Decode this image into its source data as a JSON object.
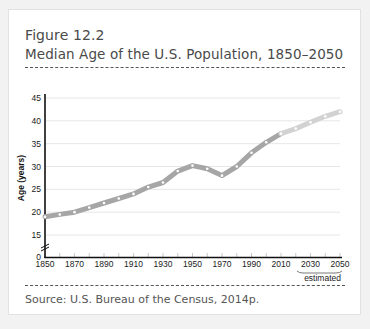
{
  "figure": {
    "number": "Figure 12.2",
    "title": "Median Age of the U.S. Population, 1850–2050",
    "source": "Source: U.S. Bureau of the Census, 2014p."
  },
  "colors": {
    "actual_line": "#a6a6a6",
    "estimated_line": "#d2d2d2",
    "marker": "#ffffff",
    "axis": "#111111",
    "grid": "#e6e6e6"
  },
  "chart_data": {
    "type": "line",
    "title": "Median Age of the U.S. Population, 1850–2050",
    "xlabel": "",
    "ylabel": "Age (years)",
    "x": [
      1850,
      1860,
      1870,
      1880,
      1890,
      1900,
      1910,
      1920,
      1930,
      1940,
      1950,
      1960,
      1970,
      1980,
      1990,
      2000,
      2010,
      2020,
      2030,
      2040,
      2050
    ],
    "series": [
      {
        "name": "Median age",
        "values": [
          19,
          19.5,
          20,
          21,
          22,
          23,
          24,
          25.5,
          26.5,
          29,
          30.2,
          29.5,
          28,
          30,
          33,
          35.3,
          37.2,
          38.3,
          39.7,
          41,
          42
        ]
      }
    ],
    "estimated_from": 2010,
    "estimated_label": "estimated",
    "x_tick_labels": [
      "1850",
      "1870",
      "1890",
      "1910",
      "1930",
      "1950",
      "1970",
      "1990",
      "2010",
      "2030",
      "2050"
    ],
    "y_tick_labels": [
      "0",
      "15",
      "20",
      "25",
      "30",
      "35",
      "40",
      "45"
    ],
    "ylim": [
      0,
      45
    ],
    "y_axis_break": true,
    "grid": true,
    "legend": "none"
  }
}
